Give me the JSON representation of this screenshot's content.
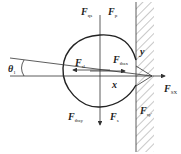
{
  "diagram": {
    "labels": {
      "f_qs": {
        "main": "F",
        "sub": "qs"
      },
      "f_p": {
        "main": "F",
        "sub": "p"
      },
      "f_sl": {
        "main": "F",
        "sub": "sl"
      },
      "f_thsx": {
        "main": "F",
        "sub": "thsx"
      },
      "f_sx": {
        "main": "F",
        "sub": "SX"
      },
      "f_thsy": {
        "main": "F",
        "sub": "thsy"
      },
      "f_s": {
        "main": "F",
        "sub": "s"
      },
      "f_sy": {
        "main": "F",
        "sub": "sy′"
      },
      "theta": {
        "main": "θ",
        "sub": "1"
      },
      "x_axis": "x",
      "y_axis": "y"
    }
  }
}
